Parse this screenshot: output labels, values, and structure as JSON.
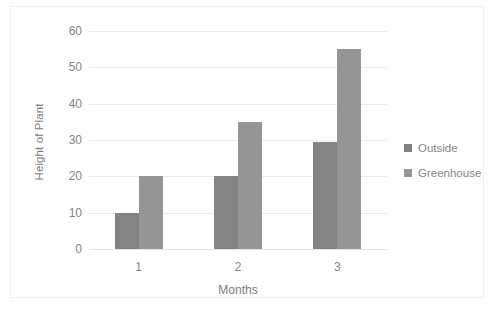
{
  "chart_data": {
    "type": "bar",
    "title": "",
    "categories": [
      "1",
      "2",
      "3"
    ],
    "xlabel": "Months",
    "ylabel": "Height of Plant",
    "ylim": [
      0,
      60
    ],
    "ytick_step": 10,
    "yticks": [
      "0",
      "10",
      "20",
      "30",
      "40",
      "50",
      "60"
    ],
    "grid": true,
    "legend_position": "right",
    "series": [
      {
        "name": "Outside",
        "color": "#838383",
        "values": [
          10,
          20,
          29.5
        ]
      },
      {
        "name": "Greenhouse",
        "color": "#959595",
        "values": [
          20,
          35,
          55
        ]
      }
    ]
  },
  "colors": {
    "gridline": "#eaeaea",
    "frame_border": "#f0f0f0",
    "text": "#858585",
    "background": "#ffffff"
  }
}
